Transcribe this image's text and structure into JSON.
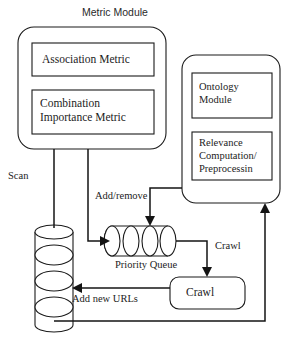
{
  "diagram": {
    "title": "Metric Module",
    "modules": {
      "metric_module": {
        "name": "Metric Module",
        "boxes": [
          {
            "id": "association-metric",
            "label": "Association Metric"
          },
          {
            "id": "combination-importance-metric",
            "label": "Combination\nImportance Metric"
          }
        ]
      },
      "right_module": {
        "name": "",
        "boxes": [
          {
            "id": "ontology-module",
            "label": "Ontology\nModule"
          },
          {
            "id": "relevance-computation",
            "label": "Relevance\nComputation/\nPreprocessin"
          }
        ]
      }
    },
    "nodes": {
      "url_repository": {
        "id": "url-repository",
        "label": ""
      },
      "priority_queue": {
        "id": "priority-queue",
        "label": "Priority Queue"
      },
      "crawl_box": {
        "id": "crawl-box",
        "label": "Crawl"
      }
    },
    "edge_labels": {
      "scan": "Scan",
      "add_remove": "Add/remove",
      "crawl_right": "Crawl",
      "add_new_urls": "Add new URLs"
    },
    "colors": {
      "stroke": "#1a1a1a",
      "connector": "#141414",
      "background": "#ffffff",
      "text": "#1c1c1c"
    }
  }
}
